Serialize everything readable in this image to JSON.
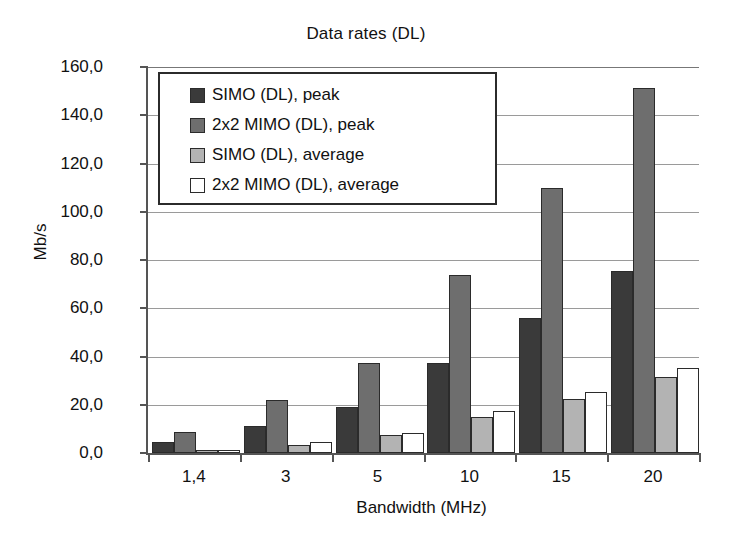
{
  "chart_data": {
    "type": "bar",
    "title": "Data rates (DL)",
    "xlabel": "Bandwidth (MHz)",
    "ylabel": "Mb/s",
    "categories": [
      "1,4",
      "3",
      "5",
      "10",
      "15",
      "20"
    ],
    "ylim": [
      0,
      160
    ],
    "ytick_step": 20,
    "ytick_labels": [
      "0,0",
      "20,0",
      "40,0",
      "60,0",
      "80,0",
      "100,0",
      "120,0",
      "140,0",
      "160,0"
    ],
    "ytick_values": [
      0,
      20,
      40,
      60,
      80,
      100,
      120,
      140,
      160
    ],
    "grid": true,
    "legend_position": "top-left-inside",
    "series": [
      {
        "name": "SIMO (DL), peak",
        "color": "#3a3a3a",
        "values": [
          4.5,
          11.3,
          18.9,
          37.3,
          56.0,
          75.4
        ]
      },
      {
        "name": "2x2 MIMO (DL), peak",
        "color": "#6e6e6e",
        "values": [
          8.8,
          21.8,
          37.3,
          73.7,
          110.0,
          151.2
        ]
      },
      {
        "name": "SIMO (DL), average",
        "color": "#b3b3b3",
        "values": [
          1.2,
          3.5,
          7.5,
          15.0,
          22.5,
          31.7
        ]
      },
      {
        "name": "2x2 MIMO (DL), average",
        "color": "#ffffff",
        "values": [
          1.3,
          4.5,
          8.4,
          17.3,
          25.4,
          35.4
        ]
      }
    ]
  },
  "style": {
    "axis_color": "#555555",
    "grid_color": "#9a9a9a",
    "bar_outline": "#2b2b2b",
    "text_color": "#111111",
    "background": "#ffffff"
  }
}
